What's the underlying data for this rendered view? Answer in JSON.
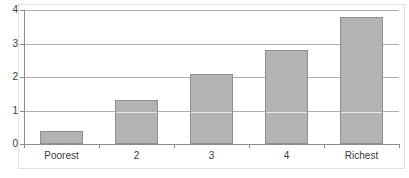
{
  "chart_data": {
    "type": "bar",
    "title": "",
    "subtitle": "",
    "xlabel": "",
    "ylabel": "",
    "categories": [
      "Poorest",
      "2",
      "3",
      "4",
      "Richest"
    ],
    "values": [
      0.4,
      1.3,
      2.1,
      2.8,
      3.8
    ],
    "series": [
      {
        "name": "",
        "values": [
          0.4,
          1.3,
          2.1,
          2.8,
          3.8
        ]
      }
    ],
    "ylim": [
      0,
      4
    ],
    "ytick_labels": [
      "0",
      "1",
      "2",
      "3",
      "4"
    ],
    "ytick_values": [
      0,
      1,
      2,
      3,
      4
    ],
    "xtick_labels": [
      "Poorest",
      "2",
      "3",
      "4",
      "Richest"
    ],
    "grid": true,
    "grid_axis": "y",
    "legend": false,
    "legend_position": "none",
    "annotations": [],
    "colors": {
      "bar_fill": "#b3b3b3",
      "bar_edge": "#8f8f8f",
      "gridline": "#aeaeae",
      "axis_line": "#8c8c8c",
      "frame": "#e2e2e2",
      "text": "#3a3a3a",
      "background": "#ffffff"
    }
  }
}
